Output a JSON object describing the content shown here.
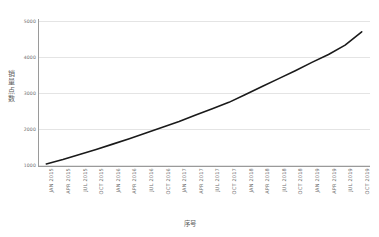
{
  "chart_data": {
    "type": "line",
    "title": "",
    "subtitle": "",
    "xlabel": "序号",
    "ylabel": "销量点数",
    "grid": true,
    "legend": false,
    "legend_position": "none",
    "line_color": "#1a1a1a",
    "grid_color": "#e4e4e4",
    "axis_color": "#9a9a9a",
    "ylim": [
      1000,
      5000
    ],
    "yticks": [
      1000,
      2000,
      3000,
      4000,
      5000
    ],
    "ytick_labels": [
      "1000",
      "2000",
      "3000",
      "4000",
      "5000"
    ],
    "categories": [
      "JAN 2015",
      "APR 2015",
      "JUL 2015",
      "OCT 2015",
      "JAN 2016",
      "APR 2016",
      "JUL 2016",
      "OCT 2016",
      "JAN 2017",
      "APR 2017",
      "JUL 2017",
      "OCT 2017",
      "JAN 2018",
      "APR 2018",
      "JUL 2018",
      "OCT 2018",
      "JAN 2019",
      "APR 2019",
      "JUL 2019",
      "OCT 2019"
    ],
    "values": [
      1030,
      1150,
      1290,
      1430,
      1580,
      1730,
      1890,
      2050,
      2210,
      2390,
      2560,
      2740,
      2960,
      3180,
      3400,
      3620,
      3850,
      4070,
      4330,
      4700
    ]
  }
}
